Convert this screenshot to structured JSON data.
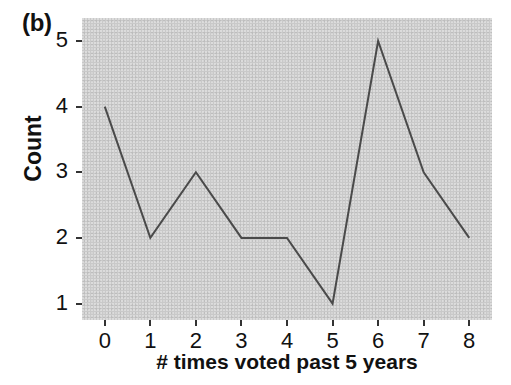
{
  "figure": {
    "panel_label": "(b)",
    "background_color": "#ffffff",
    "plot_background_color": "#c9c9c9",
    "line_color": "#4a4a4a",
    "text_color": "#111111"
  },
  "chart_data": {
    "type": "line",
    "title": "",
    "panel": "(b)",
    "xlabel": "# times voted past 5 years",
    "ylabel": "Count",
    "x": [
      0,
      1,
      2,
      3,
      4,
      5,
      6,
      7,
      8
    ],
    "values": [
      4,
      2,
      3,
      2,
      2,
      1,
      5,
      3,
      2
    ],
    "xticks": [
      "0",
      "1",
      "2",
      "3",
      "4",
      "5",
      "6",
      "7",
      "8"
    ],
    "yticks": [
      "1",
      "2",
      "3",
      "4",
      "5"
    ],
    "xlim": [
      -0.5,
      8.5
    ],
    "ylim": [
      0.75,
      5.35
    ],
    "grid": false,
    "legend": false,
    "legend_position": "none",
    "marker": "none",
    "line_width": 2
  }
}
